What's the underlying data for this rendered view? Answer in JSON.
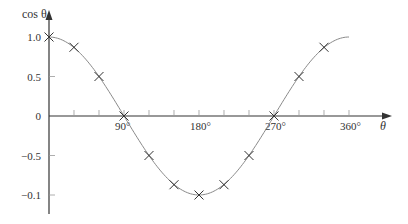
{
  "chart_data": {
    "type": "line",
    "title": "",
    "xlabel": "θ",
    "ylabel": "cos θ",
    "x_unit": "degrees",
    "xlim": [
      0,
      360
    ],
    "ylim": [
      -1.15,
      1.1
    ],
    "grid": false,
    "legend": null,
    "x_tick_labels": [
      {
        "value": 90,
        "label": "90°"
      },
      {
        "value": 180,
        "label": "180°"
      },
      {
        "value": 270,
        "label": "270°"
      },
      {
        "value": 360,
        "label": "360°"
      }
    ],
    "x_minor_ticks": [
      30,
      60,
      120,
      150,
      210,
      240,
      300,
      330
    ],
    "y_tick_labels": [
      {
        "value": 1.0,
        "label": "1.0"
      },
      {
        "value": 0.5,
        "label": "0.5"
      },
      {
        "value": 0,
        "label": "0"
      },
      {
        "value": -0.5,
        "label": "−0.5"
      },
      {
        "value": -1.0,
        "label": "−0.1"
      }
    ],
    "series": [
      {
        "name": "cos θ curve",
        "style": "smooth-line",
        "x": [
          0,
          360
        ],
        "function": "cos"
      },
      {
        "name": "plotted points",
        "style": "x-markers",
        "x": [
          0,
          30,
          60,
          90,
          120,
          150,
          180,
          210,
          240,
          270,
          300,
          330
        ],
        "values": [
          1.0,
          0.87,
          0.5,
          0,
          -0.5,
          -0.87,
          -1.0,
          -0.87,
          -0.5,
          0,
          0.5,
          0.87
        ]
      }
    ]
  },
  "colors": {
    "axis": "#333333",
    "curve": "#8a8a8a",
    "marker": "#333333",
    "text": "#333333"
  },
  "layout": {
    "origin_x": 49,
    "origin_y": 116,
    "px_per_degree": 0.8333,
    "px_per_unit_y": 79,
    "x_axis_end": 392,
    "y_axis_top": 10,
    "y_axis_bottom": 214
  }
}
